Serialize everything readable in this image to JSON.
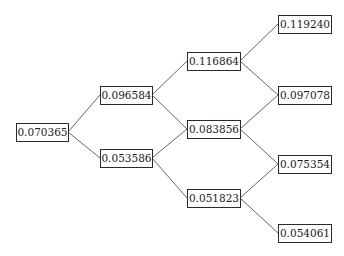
{
  "diagram": {
    "type": "binomial-tree",
    "levels": 4,
    "nodes": [
      {
        "id": "n0",
        "level": 0,
        "value": "0.070365",
        "x": 16,
        "y": 123,
        "w": 52,
        "h": 18
      },
      {
        "id": "n1u",
        "level": 1,
        "value": "0.096584",
        "x": 100,
        "y": 86,
        "w": 52,
        "h": 18
      },
      {
        "id": "n1d",
        "level": 1,
        "value": "0.053586",
        "x": 100,
        "y": 149,
        "w": 52,
        "h": 18
      },
      {
        "id": "n2u",
        "level": 2,
        "value": "0.116864",
        "x": 187,
        "y": 52,
        "w": 53,
        "h": 18
      },
      {
        "id": "n2m",
        "level": 2,
        "value": "0.083856",
        "x": 187,
        "y": 120,
        "w": 53,
        "h": 18
      },
      {
        "id": "n2d",
        "level": 2,
        "value": "0.051823",
        "x": 187,
        "y": 189,
        "w": 53,
        "h": 18
      },
      {
        "id": "n3a",
        "level": 3,
        "value": "0.119240",
        "x": 278,
        "y": 15,
        "w": 53,
        "h": 18
      },
      {
        "id": "n3b",
        "level": 3,
        "value": "0.097078",
        "x": 278,
        "y": 86,
        "w": 53,
        "h": 18
      },
      {
        "id": "n3c",
        "level": 3,
        "value": "0.075354",
        "x": 278,
        "y": 155,
        "w": 53,
        "h": 18
      },
      {
        "id": "n3d",
        "level": 3,
        "value": "0.054061",
        "x": 278,
        "y": 224,
        "w": 53,
        "h": 18
      }
    ],
    "edges": [
      [
        "n0",
        "n1u"
      ],
      [
        "n0",
        "n1d"
      ],
      [
        "n1u",
        "n2u"
      ],
      [
        "n1u",
        "n2m"
      ],
      [
        "n1d",
        "n2m"
      ],
      [
        "n1d",
        "n2d"
      ],
      [
        "n2u",
        "n3a"
      ],
      [
        "n2u",
        "n3b"
      ],
      [
        "n2m",
        "n3b"
      ],
      [
        "n2m",
        "n3c"
      ],
      [
        "n2d",
        "n3c"
      ],
      [
        "n2d",
        "n3d"
      ]
    ],
    "colors": {
      "line": "#555555",
      "box_border": "#2a2a2a",
      "text": "#1a1a1a",
      "background": "#ffffff"
    }
  }
}
